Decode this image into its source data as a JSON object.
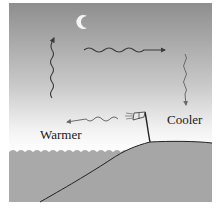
{
  "diagram": {
    "type": "night land breeze",
    "labels": {
      "warmer": "Warmer",
      "cooler": "Cooler"
    },
    "elements": {
      "moon": "crescent-moon-icon",
      "windsock": "windsock-icon",
      "arrows": [
        {
          "name": "rising-air-arrow",
          "direction": "up",
          "side": "sea"
        },
        {
          "name": "upper-flow-arrow",
          "direction": "right",
          "side": "aloft"
        },
        {
          "name": "sinking-air-arrow",
          "direction": "down",
          "side": "land"
        },
        {
          "name": "surface-breeze-arrow",
          "direction": "left",
          "side": "surface"
        }
      ]
    },
    "colors": {
      "sky_top": "#8c8c8c",
      "sky_bottom": "#f2f2f2",
      "water": "#a8a8a8",
      "land": "#a8a8a8",
      "arrow": "#3a3a3a",
      "moon": "#f4f4f4"
    }
  }
}
